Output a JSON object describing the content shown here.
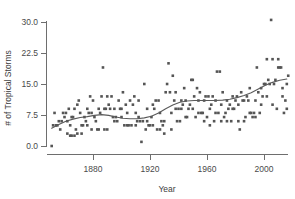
{
  "chart_data": {
    "type": "scatter",
    "title": "",
    "xlabel": "Year",
    "ylabel": "# of Tropical Storms",
    "xlim": [
      1850,
      2017
    ],
    "ylim": [
      0,
      31
    ],
    "grid": false,
    "legend": null,
    "x_ticks": [
      1880,
      1920,
      1960,
      2000
    ],
    "x_tick_labels": [
      "1880",
      "1920",
      "1960",
      "2000"
    ],
    "y_ticks": [
      0.0,
      7.5,
      15.0,
      22.5,
      30.0
    ],
    "y_tick_labels": [
      "0.0",
      "7.5",
      "15.0",
      "22.5",
      "30.0"
    ],
    "marker": "filled-square",
    "marker_color": "#555555",
    "points": [
      [
        1851,
        0.0
      ],
      [
        1852,
        5.0
      ],
      [
        1853,
        8.0
      ],
      [
        1854,
        5.0
      ],
      [
        1855,
        5.0
      ],
      [
        1856,
        6.0
      ],
      [
        1857,
        4.0
      ],
      [
        1858,
        6.0
      ],
      [
        1859,
        8.0
      ],
      [
        1860,
        7.0
      ],
      [
        1861,
        8.0
      ],
      [
        1862,
        6.0
      ],
      [
        1863,
        9.0
      ],
      [
        1864,
        5.0
      ],
      [
        1865,
        7.0
      ],
      [
        1866,
        7.0
      ],
      [
        1867,
        9.0
      ],
      [
        1868,
        4.0
      ],
      [
        1869,
        10.0
      ],
      [
        1870,
        11.0
      ],
      [
        1871,
        8.0
      ],
      [
        1872,
        5.0
      ],
      [
        1873,
        5.0
      ],
      [
        1874,
        7.0
      ],
      [
        1875,
        6.0
      ],
      [
        1876,
        5.0
      ],
      [
        1877,
        8.0
      ],
      [
        1878,
        12.0
      ],
      [
        1879,
        8.0
      ],
      [
        1880,
        11.0
      ],
      [
        1881,
        7.0
      ],
      [
        1882,
        6.0
      ],
      [
        1883,
        4.0
      ],
      [
        1884,
        4.0
      ],
      [
        1885,
        8.0
      ],
      [
        1886,
        12.0
      ],
      [
        1887,
        19.0
      ],
      [
        1888,
        9.0
      ],
      [
        1889,
        9.0
      ],
      [
        1890,
        4.0
      ],
      [
        1891,
        10.0
      ],
      [
        1892,
        9.0
      ],
      [
        1893,
        12.0
      ],
      [
        1894,
        7.0
      ],
      [
        1895,
        6.0
      ],
      [
        1896,
        7.0
      ],
      [
        1897,
        6.0
      ],
      [
        1898,
        11.0
      ],
      [
        1899,
        9.0
      ],
      [
        1900,
        7.0
      ],
      [
        1901,
        13.0
      ],
      [
        1902,
        5.0
      ],
      [
        1903,
        10.0
      ],
      [
        1904,
        5.0
      ],
      [
        1905,
        5.0
      ],
      [
        1906,
        11.0
      ],
      [
        1907,
        5.0
      ],
      [
        1908,
        10.0
      ],
      [
        1909,
        12.0
      ],
      [
        1910,
        5.0
      ],
      [
        1911,
        6.0
      ],
      [
        1912,
        7.0
      ],
      [
        1913,
        6.0
      ],
      [
        1914,
        1.0
      ],
      [
        1915,
        6.0
      ],
      [
        1916,
        15.0
      ],
      [
        1917,
        4.0
      ],
      [
        1918,
        6.0
      ],
      [
        1919,
        5.0
      ],
      [
        1920,
        5.0
      ],
      [
        1921,
        7.0
      ],
      [
        1922,
        5.0
      ],
      [
        1923,
        9.0
      ],
      [
        1924,
        11.0
      ],
      [
        1925,
        4.0
      ],
      [
        1926,
        11.0
      ],
      [
        1927,
        8.0
      ],
      [
        1928,
        6.0
      ],
      [
        1929,
        5.0
      ],
      [
        1930,
        3.0
      ],
      [
        1931,
        13.0
      ],
      [
        1932,
        15.0
      ],
      [
        1933,
        20.0
      ],
      [
        1934,
        13.0
      ],
      [
        1935,
        8.0
      ],
      [
        1936,
        17.0
      ],
      [
        1937,
        11.0
      ],
      [
        1938,
        9.0
      ],
      [
        1939,
        6.0
      ],
      [
        1940,
        9.0
      ],
      [
        1941,
        6.0
      ],
      [
        1942,
        11.0
      ],
      [
        1943,
        10.0
      ],
      [
        1944,
        14.0
      ],
      [
        1945,
        11.0
      ],
      [
        1946,
        7.0
      ],
      [
        1947,
        9.0
      ],
      [
        1948,
        10.0
      ],
      [
        1949,
        16.0
      ],
      [
        1950,
        16.0
      ],
      [
        1951,
        12.0
      ],
      [
        1952,
        7.0
      ],
      [
        1953,
        14.0
      ],
      [
        1954,
        11.0
      ],
      [
        1955,
        13.0
      ],
      [
        1956,
        8.0
      ],
      [
        1957,
        8.0
      ],
      [
        1958,
        11.0
      ],
      [
        1959,
        12.0
      ],
      [
        1960,
        7.0
      ],
      [
        1961,
        12.0
      ],
      [
        1962,
        5.0
      ],
      [
        1963,
        10.0
      ],
      [
        1964,
        12.0
      ],
      [
        1965,
        6.0
      ],
      [
        1966,
        11.0
      ],
      [
        1967,
        18.0
      ],
      [
        1968,
        8.0
      ],
      [
        1969,
        18.0
      ],
      [
        1970,
        10.0
      ],
      [
        1971,
        13.0
      ],
      [
        1972,
        7.0
      ],
      [
        1973,
        8.0
      ],
      [
        1974,
        11.0
      ],
      [
        1975,
        9.0
      ],
      [
        1976,
        10.0
      ],
      [
        1977,
        6.0
      ],
      [
        1978,
        12.0
      ],
      [
        1979,
        9.0
      ],
      [
        1980,
        11.0
      ],
      [
        1981,
        12.0
      ],
      [
        1982,
        6.0
      ],
      [
        1983,
        4.0
      ],
      [
        1984,
        13.0
      ],
      [
        1985,
        11.0
      ],
      [
        1986,
        6.0
      ],
      [
        1987,
        7.0
      ],
      [
        1988,
        12.0
      ],
      [
        1989,
        11.0
      ],
      [
        1990,
        14.0
      ],
      [
        1991,
        8.0
      ],
      [
        1992,
        7.0
      ],
      [
        1993,
        8.0
      ],
      [
        1994,
        7.0
      ],
      [
        1995,
        19.0
      ],
      [
        1996,
        13.0
      ],
      [
        1997,
        8.0
      ],
      [
        1998,
        14.0
      ],
      [
        1999,
        12.0
      ],
      [
        2000,
        15.0
      ],
      [
        2001,
        15.0
      ],
      [
        2002,
        12.0
      ],
      [
        2003,
        16.0
      ],
      [
        2004,
        15.0
      ],
      [
        2005,
        30.5
      ],
      [
        2006,
        10.0
      ],
      [
        2007,
        15.0
      ],
      [
        2008,
        16.0
      ],
      [
        2009,
        9.0
      ],
      [
        2010,
        19.0
      ],
      [
        2011,
        19.0
      ],
      [
        2012,
        19.0
      ],
      [
        2013,
        14.0
      ],
      [
        2014,
        8.0
      ],
      [
        2015,
        11.0
      ],
      [
        2016,
        15.0
      ],
      [
        2017,
        17.0
      ],
      [
        1862,
        3.0
      ],
      [
        1864,
        2.5
      ],
      [
        1865,
        2.5
      ],
      [
        1867,
        2.5
      ],
      [
        1869,
        3.0
      ],
      [
        1872,
        3.0
      ],
      [
        1876,
        9.0
      ],
      [
        1879,
        4.0
      ],
      [
        1884,
        9.0
      ],
      [
        1888,
        4.0
      ],
      [
        1890,
        12.0
      ],
      [
        1895,
        9.0
      ],
      [
        1900,
        9.0
      ],
      [
        1904,
        8.0
      ],
      [
        1910,
        8.0
      ],
      [
        1912,
        11.0
      ],
      [
        1918,
        9.0
      ],
      [
        1922,
        10.0
      ],
      [
        1927,
        4.0
      ],
      [
        1930,
        6.0
      ],
      [
        1935,
        4.0
      ],
      [
        1938,
        13.0
      ],
      [
        1942,
        9.0
      ],
      [
        1945,
        7.0
      ],
      [
        1950,
        9.0
      ],
      [
        1954,
        8.0
      ],
      [
        1958,
        6.0
      ],
      [
        1962,
        9.0
      ],
      [
        1966,
        8.0
      ],
      [
        1970,
        6.0
      ],
      [
        1974,
        6.0
      ],
      [
        1978,
        9.0
      ],
      [
        1982,
        10.0
      ],
      [
        1986,
        11.0
      ],
      [
        1990,
        8.0
      ],
      [
        1994,
        11.0
      ],
      [
        1998,
        10.0
      ],
      [
        2002,
        21.0
      ],
      [
        2006,
        21.0
      ],
      [
        2010,
        21.0
      ],
      [
        2013,
        12.0
      ],
      [
        2016,
        9.0
      ]
    ],
    "trend_curve": {
      "name": "smoothed-trend",
      "color": "#5a5a5a",
      "points": [
        [
          1851,
          4.3
        ],
        [
          1856,
          5.2
        ],
        [
          1861,
          6.0
        ],
        [
          1866,
          6.5
        ],
        [
          1871,
          6.9
        ],
        [
          1876,
          7.1
        ],
        [
          1881,
          7.4
        ],
        [
          1886,
          7.6
        ],
        [
          1891,
          7.4
        ],
        [
          1896,
          7.0
        ],
        [
          1901,
          6.7
        ],
        [
          1906,
          6.6
        ],
        [
          1911,
          6.6
        ],
        [
          1916,
          6.8
        ],
        [
          1921,
          7.2
        ],
        [
          1926,
          8.0
        ],
        [
          1931,
          9.0
        ],
        [
          1936,
          9.9
        ],
        [
          1941,
          10.6
        ],
        [
          1946,
          10.9
        ],
        [
          1951,
          11.0
        ],
        [
          1956,
          11.0
        ],
        [
          1961,
          11.0
        ],
        [
          1966,
          11.0
        ],
        [
          1971,
          11.1
        ],
        [
          1976,
          11.3
        ],
        [
          1981,
          11.7
        ],
        [
          1986,
          12.2
        ],
        [
          1991,
          12.9
        ],
        [
          1996,
          13.8
        ],
        [
          2001,
          14.7
        ],
        [
          2006,
          15.4
        ],
        [
          2011,
          15.9
        ],
        [
          2016,
          16.2
        ]
      ]
    }
  }
}
